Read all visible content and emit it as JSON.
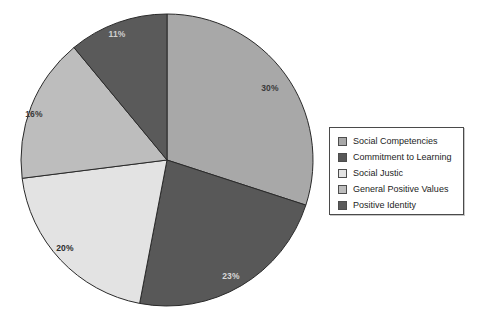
{
  "chart_data": {
    "type": "pie",
    "title": "",
    "legend_position": "right",
    "start_angle_deg": 0,
    "direction": "clockwise",
    "categories": [
      "Social Competencies",
      "Commitment to Learning",
      "Social Justic",
      "General Positive Values",
      "Positive Identity"
    ],
    "values": [
      30,
      23,
      20,
      16,
      11
    ],
    "labels": [
      "30%",
      "23%",
      "20%",
      "16%",
      "11%"
    ],
    "colors": [
      "#a8a8a8",
      "#585858",
      "#e3e3e3",
      "#bdbdbd",
      "#5a5a5a"
    ],
    "label_colors": [
      "#3a3a3a",
      "#d8d8d8",
      "#2b2b2b",
      "#3a3a3a",
      "#cfcfcf"
    ],
    "slices": [
      {
        "name": "Social Competencies",
        "value": 30,
        "label": "30%",
        "color": "#a8a8a8",
        "label_color": "#3a3a3a",
        "label_x": 270,
        "label_y": 91
      },
      {
        "name": "Commitment to Learning",
        "value": 23,
        "label": "23%",
        "color": "#585858",
        "label_color": "#d8d8d8",
        "label_x": 231,
        "label_y": 279
      },
      {
        "name": "Social Justic",
        "value": 20,
        "label": "20%",
        "color": "#e3e3e3",
        "label_color": "#2b2b2b",
        "label_x": 65,
        "label_y": 251
      },
      {
        "name": "General Positive Values",
        "value": 16,
        "label": "16%",
        "color": "#bdbdbd",
        "label_color": "#3a3a3a",
        "label_x": 34,
        "label_y": 117
      },
      {
        "name": "Positive Identity",
        "value": 11,
        "label": "11%",
        "color": "#5a5a5a",
        "label_color": "#cfcfcf",
        "label_x": 117,
        "label_y": 37
      }
    ],
    "geometry": {
      "cx": 167,
      "cy": 160,
      "r": 146
    },
    "outline_color": "#2a2a2a"
  },
  "legend": {
    "items": [
      {
        "label": "Social Competencies",
        "color": "#a8a8a8"
      },
      {
        "label": "Commitment to Learning",
        "color": "#585858"
      },
      {
        "label": "Social Justic",
        "color": "#e3e3e3"
      },
      {
        "label": "General Positive Values",
        "color": "#bdbdbd"
      },
      {
        "label": "Positive Identity",
        "color": "#5a5a5a"
      }
    ]
  }
}
